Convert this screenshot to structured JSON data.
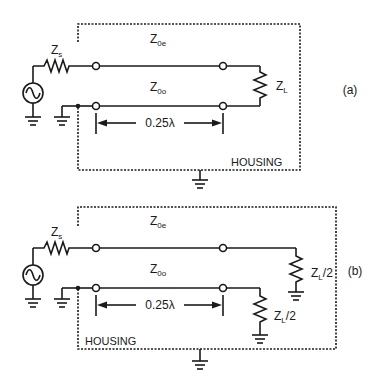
{
  "diagrams": [
    {
      "label": "(a)",
      "source_impedance": "Z",
      "source_impedance_sub": "s",
      "even_mode": "Z",
      "even_mode_sub": "0e",
      "odd_mode": "Z",
      "odd_mode_sub": "0o",
      "length": "0.25λ",
      "load": "Z",
      "load_sub": "L",
      "housing": "HOUSING"
    },
    {
      "label": "(b)",
      "source_impedance": "Z",
      "source_impedance_sub": "s",
      "even_mode": "Z",
      "even_mode_sub": "0e",
      "odd_mode": "Z",
      "odd_mode_sub": "0o",
      "length": "0.25λ",
      "load_upper": "Z",
      "load_upper_sub": "L",
      "load_upper_suffix": "/2",
      "load_lower": "Z",
      "load_lower_sub": "L",
      "load_lower_suffix": "/2",
      "housing": "HOUSING"
    }
  ]
}
